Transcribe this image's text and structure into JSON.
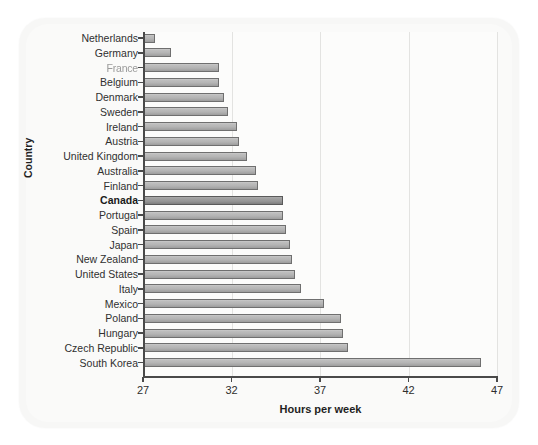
{
  "chart_data": {
    "type": "bar",
    "orientation": "horizontal",
    "title": "",
    "xlabel": "Hours per week",
    "ylabel": "Country",
    "xlim": [
      27,
      47
    ],
    "xticks": [
      27,
      32,
      37,
      42,
      47
    ],
    "grid": true,
    "legend": false,
    "highlight_category": "Canada",
    "categories": [
      "Netherlands",
      "Germany",
      "France",
      "Belgium",
      "Denmark",
      "Sweden",
      "Ireland",
      "Austria",
      "United Kingdom",
      "Australia",
      "Finland",
      "Canada",
      "Portugal",
      "Spain",
      "Japan",
      "New Zealand",
      "United States",
      "Italy",
      "Mexico",
      "Poland",
      "Hungary",
      "Czech Republic",
      "South Korea"
    ],
    "values": [
      27.7,
      28.6,
      31.3,
      31.3,
      31.6,
      31.8,
      32.3,
      32.4,
      32.9,
      33.4,
      33.5,
      34.9,
      34.9,
      35.1,
      35.3,
      35.4,
      35.6,
      35.9,
      37.2,
      38.2,
      38.3,
      38.6,
      46.1
    ]
  },
  "axis": {
    "x_title": "Hours per week",
    "y_title": "Country",
    "tick_labels": [
      "27",
      "32",
      "37",
      "42",
      "47"
    ]
  },
  "style": {
    "bar_fill": "#b4b4b4",
    "bar_border": "#6f6f6f",
    "highlight_fill": "#969696",
    "panel_background": "#f7f7f6",
    "plot_background": "#fcfcfb",
    "grid_color": "#e3e3e1",
    "axis_color": "#4a4a4a"
  }
}
